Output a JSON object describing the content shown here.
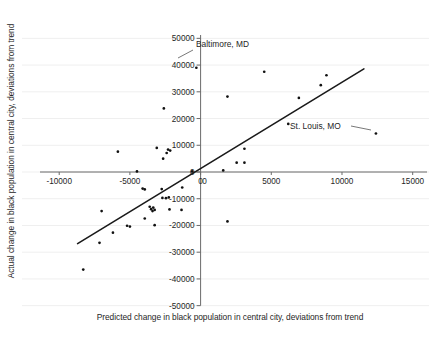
{
  "figure": {
    "title": "",
    "xlabel": "Predicted change in black population in central city, deviations from trend",
    "ylabel": "Actual change in black population in central city, deviations from trend"
  },
  "axes": {
    "x_ticks": [
      "-10000",
      "-5000",
      "0",
      "5000",
      "10000",
      "15000"
    ],
    "y_ticks": [
      "50000",
      "40000",
      "30000",
      "20000",
      "10000",
      "0",
      "-10000",
      "-20000",
      "-30000",
      "-40000",
      "-50000"
    ],
    "x_origin_label": "0"
  },
  "annotations": [
    {
      "label": "Baltimore, MD",
      "target_x": -300,
      "target_y": 39000
    },
    {
      "label": "St. Louis, MO",
      "target_x": 12400,
      "target_y": 14400
    }
  ],
  "colors": {
    "marker": "#111111",
    "trendline": "#1a1a1a",
    "axis": "#6b6b6b",
    "gridline": "#efefef",
    "text": "#262626",
    "background": "#ffffff"
  },
  "chart_data": {
    "type": "scatter",
    "title": "",
    "xlabel": "Predicted change in black population in central city, deviations from trend",
    "ylabel": "Actual change in black population in central city, deviations from trend",
    "xlim": [
      -11500,
      15800
    ],
    "ylim": [
      -52000,
      52000
    ],
    "xticks": [
      -10000,
      -5000,
      0,
      5000,
      10000,
      15000
    ],
    "yticks": [
      50000,
      40000,
      30000,
      20000,
      10000,
      0,
      -10000,
      -20000,
      -30000,
      -40000,
      -50000
    ],
    "grid": "horizontal-faint",
    "legend": null,
    "series": [
      {
        "name": "Cities",
        "marker": "dot",
        "points": [
          [
            -300,
            39000
          ],
          [
            4500,
            37500
          ],
          [
            8900,
            36200
          ],
          [
            8500,
            32500
          ],
          [
            6950,
            27700
          ],
          [
            1900,
            28200
          ],
          [
            -2600,
            23800
          ],
          [
            6200,
            18000
          ],
          [
            12400,
            14400
          ],
          [
            -5850,
            7600
          ],
          [
            -2300,
            8400
          ],
          [
            -2150,
            8000
          ],
          [
            -2400,
            7100
          ],
          [
            -3100,
            9000
          ],
          [
            -2650,
            5000
          ],
          [
            3100,
            8700
          ],
          [
            2550,
            3500
          ],
          [
            3100,
            3500
          ],
          [
            1600,
            600
          ],
          [
            -4500,
            200
          ],
          [
            -600,
            200
          ],
          [
            -1300,
            -5800
          ],
          [
            -4100,
            -6200
          ],
          [
            -3950,
            -6500
          ],
          [
            -2750,
            -6400
          ],
          [
            -2250,
            -9500
          ],
          [
            -2450,
            -9800
          ],
          [
            -2700,
            -9700
          ],
          [
            -3600,
            -13000
          ],
          [
            -3350,
            -13300
          ],
          [
            -3500,
            -13900
          ],
          [
            -3250,
            -14200
          ],
          [
            -3400,
            -14600
          ],
          [
            -2200,
            -14000
          ],
          [
            -1350,
            -14200
          ],
          [
            -7000,
            -14600
          ],
          [
            -3950,
            -17400
          ],
          [
            -3250,
            -19900
          ],
          [
            -5200,
            -20100
          ],
          [
            -5000,
            -20400
          ],
          [
            -6200,
            -22700
          ],
          [
            -7150,
            -26500
          ],
          [
            -8300,
            -36500
          ],
          [
            1900,
            -18500
          ]
        ]
      }
    ],
    "trendline": {
      "type": "line",
      "x_start": -8700,
      "y_start": -26800,
      "x_end": 11550,
      "y_end": 38600
    }
  }
}
